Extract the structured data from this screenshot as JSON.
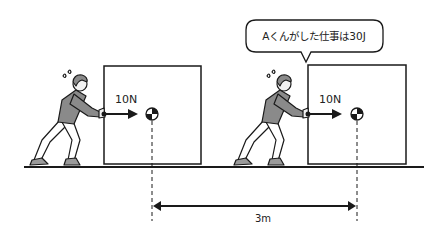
{
  "speech_bubble": {
    "text": "Aくんがした仕事は30J"
  },
  "scenes": [
    {
      "force_label": "10N"
    },
    {
      "force_label": "10N"
    }
  ],
  "distance": {
    "label": "3m"
  },
  "colors": {
    "line": "#1a1a1a",
    "shirt": "#8a8a8a",
    "shoe": "#9a9a9a",
    "skin": "#f2f2f2"
  }
}
